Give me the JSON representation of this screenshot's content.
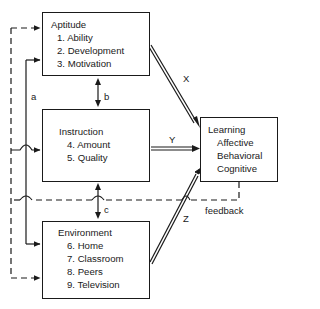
{
  "diagram": {
    "boxes": {
      "aptitude": {
        "title": "Aptitude",
        "items": [
          "1. Ability",
          "2. Development",
          "3. Motivation"
        ]
      },
      "instruction": {
        "title": "Instruction",
        "items": [
          "4. Amount",
          "5. Quality"
        ]
      },
      "environment": {
        "title": "Environment",
        "items": [
          "6. Home",
          "7. Classroom",
          "8. Peers",
          "9. Television"
        ]
      },
      "learning": {
        "title": "Learning",
        "items": [
          "Affective",
          "Behavioral",
          "Cognitive"
        ]
      }
    },
    "edge_labels": {
      "a": "a",
      "b": "b",
      "c": "c",
      "x": "X",
      "y": "Y",
      "z": "Z",
      "feedback": "feedback"
    },
    "edges": [
      {
        "from": "aptitude",
        "to": "learning",
        "label": "X",
        "style": "double"
      },
      {
        "from": "instruction",
        "to": "learning",
        "label": "Y",
        "style": "double"
      },
      {
        "from": "environment",
        "to": "learning",
        "label": "Z",
        "style": "double"
      },
      {
        "from": "aptitude",
        "to": "instruction",
        "label": "b",
        "style": "bidirectional"
      },
      {
        "from": "instruction",
        "to": "environment",
        "label": "c",
        "style": "bidirectional"
      },
      {
        "from": "aptitude/environment",
        "to": "instruction",
        "label": "a",
        "style": "solid"
      },
      {
        "from": "learning",
        "to": "aptitude/instruction/environment",
        "label": "feedback",
        "style": "dashed"
      }
    ]
  }
}
